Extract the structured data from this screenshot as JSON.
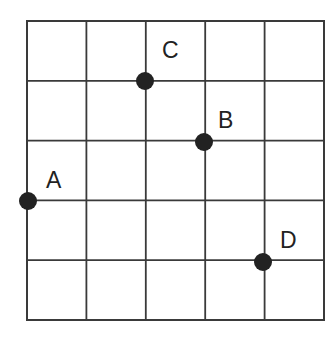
{
  "diagram": {
    "type": "grid-with-points",
    "grid": {
      "columns": 5,
      "rows": 5,
      "left": 27,
      "top": 21,
      "right": 324,
      "bottom": 320,
      "line_color": "#3a3a3a"
    },
    "points": [
      {
        "label": "A",
        "grid_x": 0,
        "grid_y": 3,
        "dot_color": "#222222"
      },
      {
        "label": "B",
        "grid_x": 3,
        "grid_y": 2,
        "dot_color": "#222222"
      },
      {
        "label": "C",
        "grid_x": 2,
        "grid_y": 1,
        "dot_color": "#222222"
      },
      {
        "label": "D",
        "grid_x": 4,
        "grid_y": 4,
        "dot_color": "#222222"
      }
    ]
  }
}
